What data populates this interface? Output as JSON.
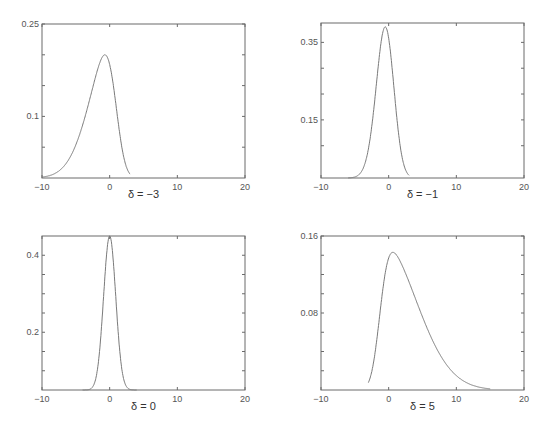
{
  "chart_data": [
    {
      "type": "line",
      "title": "",
      "caption": "δ = −3",
      "xlabel": "",
      "ylabel": "",
      "xlim": [
        -10,
        20
      ],
      "ylim": [
        0,
        0.25
      ],
      "xticks": [
        -10,
        0,
        10,
        20
      ],
      "xtick_labels": [
        "−10",
        "0",
        "10",
        "20"
      ],
      "yticks_labelled": [
        0.1,
        0.25
      ],
      "ytick_labels": [
        "0.1",
        "0.25"
      ],
      "yticks_minor": [
        0.05,
        0.15,
        0.2
      ],
      "grid": false,
      "series": [
        {
          "name": "density",
          "distribution": "skew-normal",
          "shape": -3,
          "x_range": [
            -10,
            3
          ],
          "peak": {
            "x": -1.5,
            "y": 0.2
          }
        }
      ]
    },
    {
      "type": "line",
      "title": "",
      "caption": "δ = −1",
      "xlabel": "",
      "ylabel": "",
      "xlim": [
        -10,
        20
      ],
      "ylim": [
        0,
        0.4
      ],
      "xticks": [
        -10,
        0,
        10,
        20
      ],
      "xtick_labels": [
        "−10",
        "0",
        "10",
        "20"
      ],
      "yticks_labelled": [
        0.35,
        0.15
      ],
      "ytick_labels": [
        "0.35",
        "0.15"
      ],
      "yticks_minor": [
        0.0833,
        0.2167,
        0.2833
      ],
      "grid": false,
      "series": [
        {
          "name": "density",
          "distribution": "skew-normal",
          "shape": -1,
          "x_range": [
            -6,
            3
          ],
          "peak": {
            "x": -0.8,
            "y": 0.39
          }
        }
      ]
    },
    {
      "type": "line",
      "title": "",
      "caption": "δ = 0",
      "xlabel": "",
      "ylabel": "",
      "xlim": [
        -10,
        20
      ],
      "ylim": [
        0.05,
        0.45
      ],
      "xticks": [
        -10,
        0,
        10,
        20
      ],
      "xtick_labels": [
        "−10",
        "0",
        "10",
        "20"
      ],
      "yticks_labelled": [
        0.4,
        0.2
      ],
      "ytick_labels": [
        "0.4",
        "0.2"
      ],
      "yticks_minor": [
        0.1,
        0.15,
        0.25,
        0.3,
        0.35
      ],
      "grid": false,
      "series": [
        {
          "name": "density",
          "distribution": "normal",
          "shape": 0,
          "x_range": [
            -4,
            4
          ],
          "peak": {
            "x": 0,
            "y": 0.45
          }
        }
      ]
    },
    {
      "type": "line",
      "title": "",
      "caption": "δ = 5",
      "xlabel": "",
      "ylabel": "",
      "xlim": [
        -10,
        20
      ],
      "ylim": [
        0,
        0.16
      ],
      "xticks": [
        -10,
        0,
        10,
        20
      ],
      "xtick_labels": [
        "−10",
        "0",
        "10",
        "20"
      ],
      "yticks_labelled": [
        0.16,
        0.08
      ],
      "ytick_labels": [
        "0.16",
        "0.08"
      ],
      "yticks_minor": [
        0.02,
        0.04,
        0.06,
        0.1,
        0.12,
        0.14
      ],
      "grid": false,
      "series": [
        {
          "name": "density",
          "distribution": "right-skewed",
          "shape": 5,
          "x_range": [
            -3,
            15
          ],
          "peak": {
            "x": 1.7,
            "y": 0.143
          }
        }
      ]
    }
  ]
}
